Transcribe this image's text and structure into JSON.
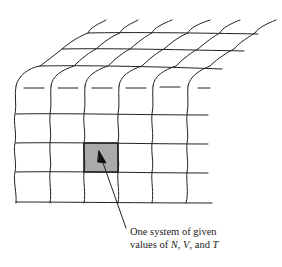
{
  "diagram": {
    "type": "ensemble-of-systems",
    "front_face": {
      "columns": 6,
      "rows": 5,
      "vertical_lines_x": [
        16,
        50,
        84,
        118,
        152,
        186
      ],
      "horizontal_lines_y": [
        114,
        143,
        172,
        202
      ],
      "dashed_row_y": 88
    },
    "top_face": {
      "rows": 3,
      "back_lines": [
        {
          "y": 66,
          "x1": 40,
          "x2": 222
        },
        {
          "y": 49,
          "x1": 62,
          "x2": 244
        },
        {
          "y": 33,
          "x1": 88,
          "x2": 258
        }
      ]
    },
    "highlighted_cell": {
      "x": 84,
      "y": 143,
      "w": 34,
      "h": 29,
      "fill": "#aaaaaa"
    },
    "line_color": "#222222",
    "annotation": {
      "line1": "One system of given",
      "line2_prefix": "values of ",
      "var1": "N",
      "sep1": ", ",
      "var2": "V",
      "sep2": ", and ",
      "var3": "T"
    }
  }
}
